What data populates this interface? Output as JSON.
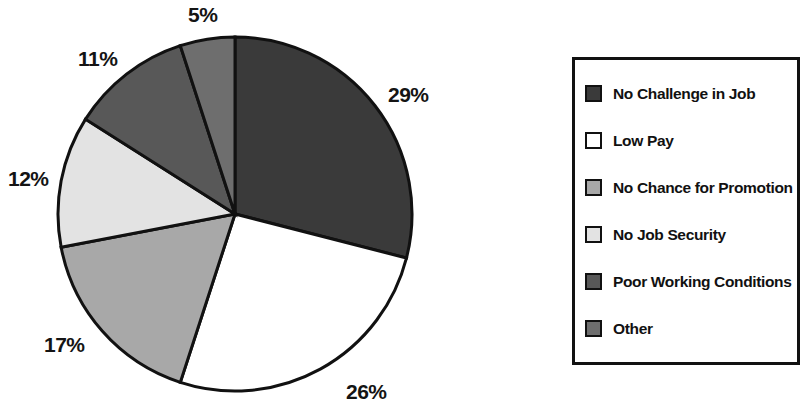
{
  "chart_data": {
    "type": "pie",
    "title": "",
    "labels": [
      "No Challenge in Job",
      "Low Pay",
      "No Chance for Promotion",
      "No Job Security",
      "Poor Working Conditions",
      "Other"
    ],
    "values": [
      29,
      26,
      17,
      12,
      11,
      5
    ],
    "value_labels": [
      "29%",
      "26%",
      "17%",
      "12%",
      "11%",
      "5%"
    ],
    "units": "percent",
    "start_angle_deg": 0,
    "direction": "clockwise",
    "legend_position": "right",
    "grid": false,
    "colors": [
      "#3a3a3a",
      "#ffffff",
      "#a8a8a8",
      "#e3e3e3",
      "#585858",
      "#6e6e6e"
    ],
    "stroke_color": "#111111"
  },
  "pie": {
    "center_x": 235,
    "center_y": 214,
    "radius": 177,
    "slices": [
      {
        "label": "No Challenge in Job",
        "value": 29,
        "value_label": "29%",
        "color": "#3a3a3a",
        "label_x": 388,
        "label_y": 84
      },
      {
        "label": "Low Pay",
        "value": 26,
        "value_label": "26%",
        "color": "#ffffff",
        "label_x": 346,
        "label_y": 381
      },
      {
        "label": "No Chance for Promotion",
        "value": 17,
        "value_label": "17%",
        "color": "#a8a8a8",
        "label_x": 44,
        "label_y": 334
      },
      {
        "label": "No Job Security",
        "value": 12,
        "value_label": "12%",
        "color": "#e3e3e3",
        "label_x": 8,
        "label_y": 168
      },
      {
        "label": "Poor Working Conditions",
        "value": 11,
        "value_label": "11%",
        "color": "#585858",
        "label_x": 78,
        "label_y": 48
      },
      {
        "label": "Other",
        "value": 5,
        "value_label": "5%",
        "color": "#6e6e6e",
        "label_x": 188,
        "label_y": 4
      }
    ]
  },
  "legend": {
    "items": [
      {
        "label": "No Challenge in Job",
        "color": "#3a3a3a"
      },
      {
        "label": "Low Pay",
        "color": "#ffffff"
      },
      {
        "label": "No Chance for Promotion",
        "color": "#a8a8a8"
      },
      {
        "label": "No Job Security",
        "color": "#e3e3e3"
      },
      {
        "label": "Poor Working Conditions",
        "color": "#585858"
      },
      {
        "label": "Other",
        "color": "#6e6e6e"
      }
    ]
  }
}
